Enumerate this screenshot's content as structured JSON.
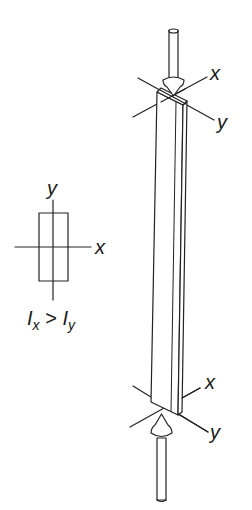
{
  "cross_section": {
    "axis_y_label": "y",
    "axis_x_label": "x",
    "inequality": {
      "lhs": "I",
      "lhs_sub": "x",
      "op": ">",
      "rhs": "I",
      "rhs_sub": "y"
    }
  },
  "column": {
    "top_axes": {
      "x_label": "x",
      "y_label": "y"
    },
    "bottom_axes": {
      "x_label": "x",
      "y_label": "y"
    }
  },
  "colors": {
    "stroke": "#222222",
    "background": "#ffffff"
  }
}
